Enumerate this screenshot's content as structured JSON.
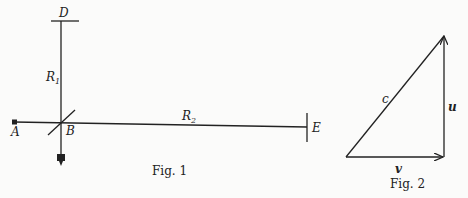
{
  "figures": [
    {
      "caption": "Fig. 1",
      "labels": {
        "A": "A",
        "B": "B",
        "D": "D",
        "E": "E",
        "R1_main": "R",
        "R1_sub": "1",
        "R2_main": "R",
        "R2_sub": "2"
      }
    },
    {
      "caption": "Fig. 2",
      "labels": {
        "c": "c",
        "u": "u",
        "v": "v"
      }
    }
  ]
}
